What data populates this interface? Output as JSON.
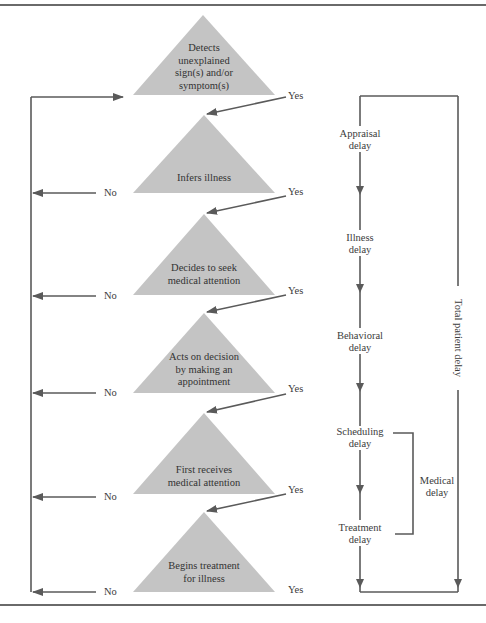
{
  "figure": {
    "steps": [
      {
        "label_lines": [
          "Detects",
          "unexplained",
          "sign(s) and/or",
          "symptom(s)"
        ],
        "yes": "Yes",
        "no": null
      },
      {
        "label_lines": [
          "Infers illness"
        ],
        "yes": "Yes",
        "no": "No"
      },
      {
        "label_lines": [
          "Decides to seek",
          "medical attention"
        ],
        "yes": "Yes",
        "no": "No"
      },
      {
        "label_lines": [
          "Acts on decision",
          "by making an",
          "appointment"
        ],
        "yes": "Yes",
        "no": "No"
      },
      {
        "label_lines": [
          "First receives",
          "medical attention"
        ],
        "yes": "Yes",
        "no": "No"
      },
      {
        "label_lines": [
          "Begins treatment",
          "for illness"
        ],
        "yes": "Yes",
        "no": "No"
      }
    ],
    "delays": [
      {
        "lines": [
          "Appraisal",
          "delay"
        ]
      },
      {
        "lines": [
          "Illness",
          "delay"
        ]
      },
      {
        "lines": [
          "Behavioral",
          "delay"
        ]
      },
      {
        "lines": [
          "Scheduling",
          "delay"
        ]
      },
      {
        "lines": [
          "Treatment",
          "delay"
        ]
      }
    ],
    "medical_delay": [
      "Medical",
      "delay"
    ],
    "total_patient_delay": "Total patient delay",
    "colors": {
      "triangle": "#c4c4c4",
      "line": "#5a5a5a",
      "rule": "#6a6a6a"
    }
  }
}
